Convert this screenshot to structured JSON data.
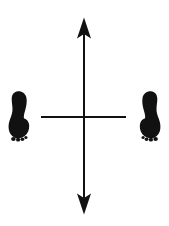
{
  "figure": {
    "caption": "Two black footprint silhouettes face each other across a crosshair formed by a vertical double-headed arrow and a short horizontal line.",
    "background_color": "#ffffff",
    "ink_color": "#111111",
    "width": 169,
    "height": 226
  },
  "elements": {
    "left_footprint": {
      "label": "Left footprint silhouette",
      "side": "left",
      "fill_color": "#111111",
      "bounds": {
        "x": 7,
        "y": 91,
        "width": 22,
        "height": 50
      }
    },
    "right_footprint": {
      "label": "Right footprint silhouette",
      "side": "right",
      "fill_color": "#111111",
      "bounds": {
        "x": 139,
        "y": 91,
        "width": 22,
        "height": 50
      }
    },
    "vertical_arrow": {
      "label": "Vertical double-headed arrow",
      "stroke_color": "#111111",
      "stroke_width": 2,
      "x": 84,
      "y_top": 18,
      "y_bottom": 214,
      "arrowheads": "both"
    },
    "horizontal_line": {
      "label": "Horizontal line",
      "stroke_color": "#111111",
      "stroke_width": 2,
      "y": 117,
      "x_start": 41,
      "x_end": 126,
      "arrowheads": "none"
    },
    "intersection": {
      "label": "Axis intersection point",
      "x": 84,
      "y": 117
    }
  },
  "chart_data": {
    "type": "scatter",
    "title": "",
    "xlabel": "",
    "ylabel": "",
    "grid": false,
    "legend_position": "none",
    "annotations": [
      {
        "name": "left-footprint",
        "x": 18,
        "y": 116,
        "marker": "footprint"
      },
      {
        "name": "right-footprint",
        "x": 150,
        "y": 116,
        "marker": "footprint"
      },
      {
        "name": "vertical-axis",
        "x": 84,
        "y": 117,
        "marker": "double-arrow-vertical"
      },
      {
        "name": "horizontal-axis",
        "x": 84,
        "y": 117,
        "marker": "line-horizontal"
      }
    ]
  }
}
